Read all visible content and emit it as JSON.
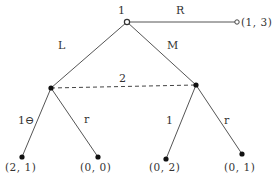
{
  "diagram": {
    "type": "extensive-form game tree",
    "players": {
      "root_player": "1",
      "info_set_player": "2"
    },
    "root_actions": {
      "left": "L",
      "middle": "M",
      "right": "R"
    },
    "terminal_R_payoff": "(1, 3)",
    "left_node_actions": {
      "left": "1⊖",
      "right": "r"
    },
    "right_node_actions": {
      "left": "1",
      "right": "r"
    },
    "leaf_payoffs": [
      "(2, 1)",
      "(0, 0)",
      "(0, 2)",
      "(0, 1)"
    ]
  }
}
